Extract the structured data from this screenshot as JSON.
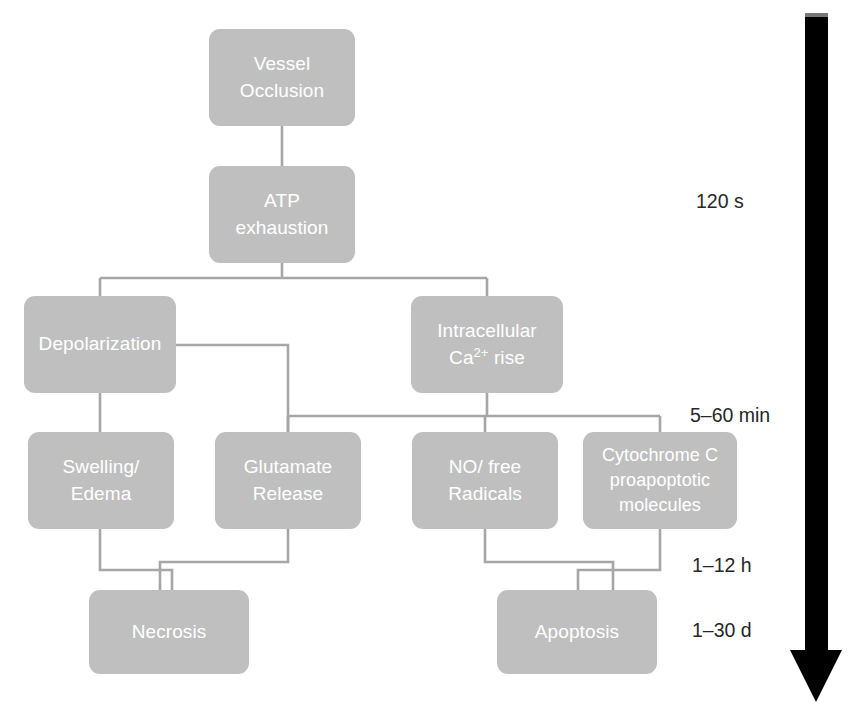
{
  "diagram": {
    "node_fill": "#bfbfbf",
    "node_text_color": "#ffffff",
    "connector_color": "#a6a6a6",
    "arrow_color": "#000000",
    "nodes": [
      {
        "id": "vessel_occlusion",
        "label": "Vessel\nOcclusion",
        "x": 209,
        "y": 29,
        "w": 146,
        "h": 97
      },
      {
        "id": "atp_exhaustion",
        "label": "ATP\nexhaustion",
        "x": 209,
        "y": 166,
        "w": 146,
        "h": 97
      },
      {
        "id": "depolarization",
        "label": "Depolarization",
        "x": 24,
        "y": 296,
        "w": 152,
        "h": 97
      },
      {
        "id": "ca_rise",
        "label": "Intracellular\nCa2+ rise",
        "label_main": "Intracellular",
        "label_sub": "rise",
        "x": 411,
        "y": 296,
        "w": 152,
        "h": 97
      },
      {
        "id": "swelling_edema",
        "label": "Swelling/\nEdema",
        "x": 28,
        "y": 432,
        "w": 146,
        "h": 97
      },
      {
        "id": "glutamate_release",
        "label": "Glutamate\nRelease",
        "x": 215,
        "y": 432,
        "w": 146,
        "h": 97
      },
      {
        "id": "no_free_radicals",
        "label": "NO/ free\nRadicals",
        "x": 412,
        "y": 432,
        "w": 146,
        "h": 97
      },
      {
        "id": "cytochrome_c",
        "label": "Cytochrome C\nproapoptotic\nmolecules",
        "x": 583,
        "y": 432,
        "w": 154,
        "h": 97
      },
      {
        "id": "necrosis",
        "label": "Necrosis",
        "x": 89,
        "y": 590,
        "w": 160,
        "h": 84
      },
      {
        "id": "apoptosis",
        "label": "Apoptosis",
        "x": 497,
        "y": 590,
        "w": 160,
        "h": 84
      }
    ],
    "time_labels": [
      {
        "id": "t_120s",
        "text": "120 s",
        "x": 696,
        "y": 190
      },
      {
        "id": "t_5_60min",
        "text": "5–60 min",
        "x": 690,
        "y": 404
      },
      {
        "id": "t_1_12h",
        "text": "1–12 h",
        "x": 692,
        "y": 554
      },
      {
        "id": "t_1_30d",
        "text": "1–30 d",
        "x": 692,
        "y": 619
      }
    ],
    "axis": {
      "id": "time-axis-arrow",
      "label": "downward time arrow",
      "top": 16,
      "bottom": 700
    }
  }
}
